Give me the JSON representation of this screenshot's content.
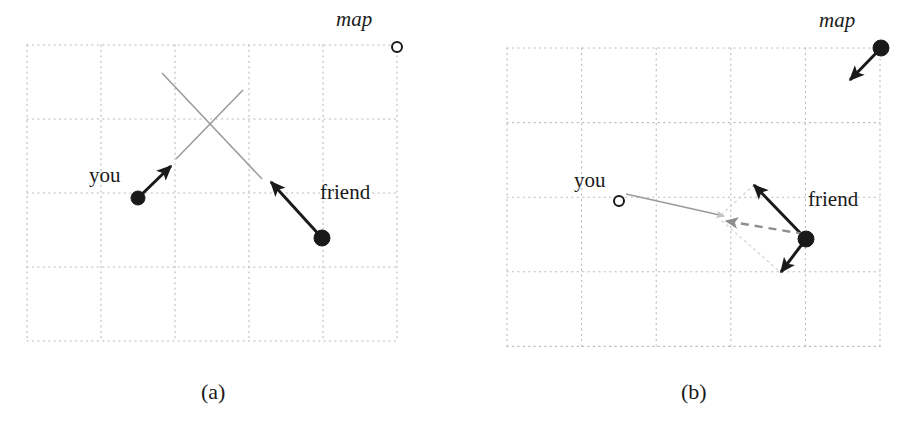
{
  "figure": {
    "title": "",
    "background_color": "#ffffff",
    "panels": [
      {
        "id": "a",
        "caption": "(a)",
        "caption_x": 201,
        "caption_y": 381,
        "grid": {
          "x": 27,
          "y": 45,
          "cols": 5,
          "rows": 4,
          "cell_w": 74,
          "cell_h": 74,
          "line_style": "dotted",
          "color": "#b9b9b9"
        },
        "labels": [
          {
            "name": "map-label",
            "text": "map",
            "style": "italic",
            "x": 336,
            "y": 9
          },
          {
            "name": "you-label",
            "text": "you",
            "style": "roman",
            "x": 89,
            "y": 165
          },
          {
            "name": "friend-label",
            "text": "friend",
            "style": "roman",
            "x": 320,
            "y": 182
          }
        ],
        "markers": [
          {
            "name": "map-marker",
            "kind": "open-circle",
            "cx": 397,
            "cy": 47,
            "r": 5,
            "color": "#1a1a1a"
          },
          {
            "name": "you-marker",
            "kind": "filled-dot",
            "cx": 138,
            "cy": 198,
            "r": 7,
            "color": "#1a1a1a"
          },
          {
            "name": "friend-marker",
            "kind": "filled-dot",
            "cx": 322,
            "cy": 238,
            "r": 8,
            "color": "#1a1a1a"
          }
        ],
        "vectors": [
          {
            "name": "you-heading-vector",
            "x1": 138,
            "y1": 198,
            "x2": 171,
            "y2": 166,
            "color": "#1a1a1a",
            "style": "solid",
            "arrow": "end"
          },
          {
            "name": "friend-heading-vector",
            "x1": 322,
            "y1": 238,
            "x2": 271,
            "y2": 182,
            "color": "#1a1a1a",
            "style": "solid",
            "arrow": "end"
          }
        ],
        "sight_lines": [
          {
            "name": "you-sight-line",
            "x1": 176,
            "y1": 159,
            "x2": 243,
            "y2": 90,
            "color": "#9a9a9a",
            "style": "solid"
          },
          {
            "name": "friend-sight-line",
            "x1": 162,
            "y1": 73,
            "x2": 262,
            "y2": 179,
            "color": "#9a9a9a",
            "style": "solid"
          }
        ]
      },
      {
        "id": "b",
        "caption": "(b)",
        "caption_x": 681,
        "caption_y": 381,
        "grid": {
          "x": 507,
          "y": 48,
          "cols": 5,
          "rows": 4,
          "cell_w": 74.6,
          "cell_h": 74.6,
          "line_style": "dotted",
          "color": "#b9b9b9"
        },
        "labels": [
          {
            "name": "map-label",
            "text": "map",
            "style": "italic",
            "x": 819,
            "y": 10
          },
          {
            "name": "you-label",
            "text": "you",
            "style": "roman",
            "x": 574,
            "y": 170
          },
          {
            "name": "friend-label",
            "text": "friend",
            "style": "roman",
            "x": 808,
            "y": 189
          }
        ],
        "markers": [
          {
            "name": "map-marker",
            "kind": "filled-dot",
            "cx": 881,
            "cy": 48,
            "r": 8,
            "color": "#1a1a1a"
          },
          {
            "name": "you-marker",
            "kind": "open-circle",
            "cx": 619,
            "cy": 201,
            "r": 5,
            "color": "#1a1a1a"
          },
          {
            "name": "friend-marker",
            "kind": "filled-dot",
            "cx": 806,
            "cy": 239,
            "r": 8,
            "color": "#1a1a1a"
          }
        ],
        "vectors": [
          {
            "name": "map-heading-vector",
            "x1": 881,
            "y1": 48,
            "x2": 850,
            "y2": 80,
            "color": "#1a1a1a",
            "style": "solid",
            "arrow": "end"
          },
          {
            "name": "friend-heading-vector-up",
            "x1": 806,
            "y1": 239,
            "x2": 754,
            "y2": 185,
            "color": "#1a1a1a",
            "style": "solid",
            "arrow": "end"
          },
          {
            "name": "friend-heading-vector-down",
            "x1": 806,
            "y1": 239,
            "x2": 781,
            "y2": 272,
            "color": "#1a1a1a",
            "style": "solid",
            "arrow": "end"
          },
          {
            "name": "friend-resultant-vector",
            "x1": 804,
            "y1": 234,
            "x2": 726,
            "y2": 221,
            "color": "#8e8e8e",
            "style": "dashed",
            "arrow": "end"
          }
        ],
        "sight_lines": [
          {
            "name": "you-sight-line",
            "x1": 626,
            "y1": 194,
            "x2": 724,
            "y2": 216,
            "color": "#9a9a9a",
            "style": "solid",
            "arrow": "end"
          },
          {
            "name": "parallelogram-edge-upper",
            "x1": 754,
            "y1": 185,
            "x2": 722,
            "y2": 214,
            "color": "#d2d2d2",
            "style": "dotted"
          },
          {
            "name": "parallelogram-edge-lower",
            "x1": 722,
            "y1": 221,
            "x2": 778,
            "y2": 270,
            "color": "#d7d7d7",
            "style": "dotted"
          }
        ]
      }
    ]
  }
}
